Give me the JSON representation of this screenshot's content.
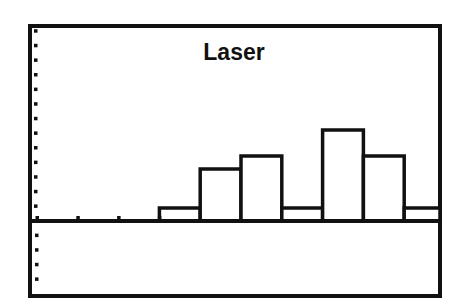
{
  "chart_data": {
    "type": "bar",
    "subtype": "histogram",
    "title": "Laser",
    "xlabel": "",
    "ylabel": "",
    "categories": [
      "bin1",
      "bin2",
      "bin3",
      "bin4",
      "bin5",
      "bin6",
      "bin7",
      "bin8",
      "bin9",
      "bin10"
    ],
    "values": [
      0,
      0,
      0,
      1,
      4,
      5,
      1,
      7,
      5,
      1
    ],
    "grid": false,
    "legend": null,
    "x_ticks_count": 4,
    "y_tick_spacing_units": 1.12,
    "style": "graphing-calculator histogram, black outlined bars on white, tick marks on left edge"
  },
  "colors": {
    "background": "#ffffff",
    "frame": "#111111",
    "bar_fill": "#ffffff",
    "bar_stroke": "#111111"
  }
}
